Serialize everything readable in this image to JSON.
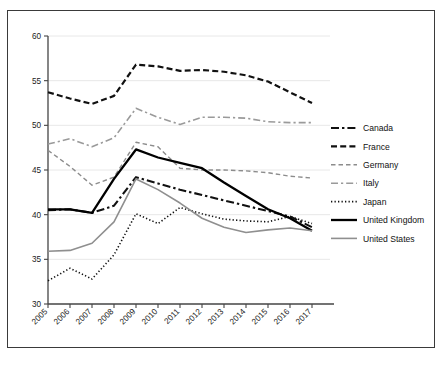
{
  "chart_data": {
    "type": "line",
    "title": "",
    "xlabel": "",
    "ylabel": "",
    "x": [
      2005,
      2006,
      2007,
      2008,
      2009,
      2010,
      2011,
      2012,
      2013,
      2014,
      2015,
      2016,
      2017
    ],
    "categories": [
      "2005",
      "2006",
      "2007",
      "2008",
      "2009",
      "2010",
      "2011",
      "2012",
      "2013",
      "2014",
      "2015",
      "2016",
      "2017"
    ],
    "ylim": [
      30,
      60
    ],
    "yticks": [
      30,
      35,
      40,
      45,
      50,
      55,
      60
    ],
    "ytick_labels": [
      "30",
      "35",
      "40",
      "45",
      "50",
      "55",
      "60"
    ],
    "grid": true,
    "legend_position": "right",
    "series": [
      {
        "name": "Canada",
        "style": "dash-dot",
        "color": "#111111",
        "width": 2.1,
        "values": [
          40.5,
          40.6,
          40.2,
          41.0,
          44.2,
          43.5,
          42.8,
          42.2,
          41.6,
          41.0,
          40.4,
          39.8,
          38.6
        ]
      },
      {
        "name": "France",
        "style": "dashed",
        "color": "#111111",
        "width": 2.2,
        "values": [
          53.7,
          53.0,
          52.4,
          53.3,
          56.8,
          56.6,
          56.1,
          56.2,
          56.0,
          55.6,
          54.9,
          53.7,
          52.5
        ]
      },
      {
        "name": "Germany",
        "style": "dashed-fine",
        "color": "#8c8c8c",
        "width": 1.4,
        "values": [
          47.2,
          45.4,
          43.3,
          44.2,
          48.1,
          47.6,
          45.2,
          45.0,
          45.0,
          44.9,
          44.7,
          44.3,
          44.1
        ]
      },
      {
        "name": "Italy",
        "style": "dash-dot-light",
        "color": "#9a9a9a",
        "width": 1.6,
        "values": [
          47.9,
          48.5,
          47.6,
          48.6,
          51.9,
          50.9,
          50.1,
          50.9,
          50.9,
          50.8,
          50.4,
          50.3,
          50.3
        ]
      },
      {
        "name": "Japan",
        "style": "dotted",
        "color": "#111111",
        "width": 1.6,
        "values": [
          32.6,
          34.0,
          32.8,
          35.5,
          40.1,
          39.0,
          40.8,
          40.1,
          39.5,
          39.3,
          39.2,
          39.8,
          39.0
        ]
      },
      {
        "name": "United Kingdom",
        "style": "solid",
        "color": "#000000",
        "width": 2.3,
        "values": [
          40.6,
          40.6,
          40.2,
          44.0,
          47.3,
          46.4,
          45.8,
          45.2,
          43.6,
          42.1,
          40.6,
          39.6,
          38.2
        ]
      },
      {
        "name": "United States",
        "style": "solid-grey",
        "color": "#8f8f8f",
        "width": 1.6,
        "values": [
          35.9,
          36.0,
          36.8,
          39.2,
          44.0,
          42.8,
          41.3,
          39.6,
          38.6,
          38.0,
          38.3,
          38.5,
          38.2
        ]
      }
    ]
  },
  "legend": {
    "items": [
      {
        "label": "Canada"
      },
      {
        "label": "France"
      },
      {
        "label": "Germany"
      },
      {
        "label": "Italy"
      },
      {
        "label": "Japan"
      },
      {
        "label": "United Kingdom"
      },
      {
        "label": "United States"
      }
    ]
  }
}
